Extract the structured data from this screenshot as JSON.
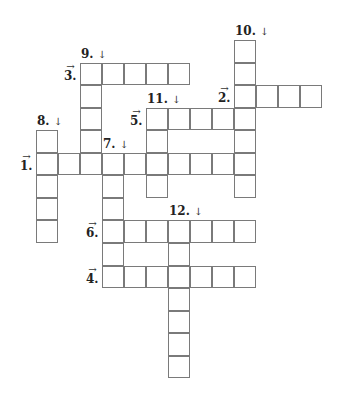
{
  "puzzle": {
    "type": "crossword",
    "grid": {
      "origin_x": 36,
      "origin_y": 40,
      "cell_w": 22,
      "cell_h": 22.55
    },
    "entries": [
      {
        "number": "1.",
        "direction": "across",
        "arrow": "→",
        "row": 5,
        "col": 0,
        "length": 10
      },
      {
        "number": "2.",
        "direction": "across",
        "arrow": "→",
        "row": 2,
        "col": 9,
        "length": 4
      },
      {
        "number": "3.",
        "direction": "across",
        "arrow": "→",
        "row": 1,
        "col": 2,
        "length": 5
      },
      {
        "number": "4.",
        "direction": "across",
        "arrow": "→",
        "row": 10,
        "col": 3,
        "length": 7
      },
      {
        "number": "5.",
        "direction": "across",
        "arrow": "→",
        "row": 3,
        "col": 5,
        "length": 5
      },
      {
        "number": "6.",
        "direction": "across",
        "arrow": "→",
        "row": 8,
        "col": 3,
        "length": 7
      },
      {
        "number": "7.",
        "direction": "down",
        "arrow": "↓",
        "row": 5,
        "col": 3,
        "length": 6
      },
      {
        "number": "8.",
        "direction": "down",
        "arrow": "↓",
        "row": 4,
        "col": 0,
        "length": 5
      },
      {
        "number": "9.",
        "direction": "down",
        "arrow": "↓",
        "row": 1,
        "col": 2,
        "length": 5
      },
      {
        "number": "10.",
        "direction": "down",
        "arrow": "↓",
        "row": 0,
        "col": 9,
        "length": 7
      },
      {
        "number": "11.",
        "direction": "down",
        "arrow": "↓",
        "row": 3,
        "col": 5,
        "length": 4
      },
      {
        "number": "12.",
        "direction": "down",
        "arrow": "↓",
        "row": 8,
        "col": 6,
        "length": 7
      }
    ]
  }
}
